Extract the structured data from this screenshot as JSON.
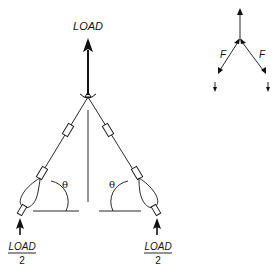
{
  "diagram": {
    "top_load_label": "LOAD",
    "angle_label_left": "θ",
    "angle_label_right": "θ",
    "bottom_left": {
      "numerator": "LOAD",
      "denominator": "2"
    },
    "bottom_right": {
      "numerator": "LOAD",
      "denominator": "2"
    },
    "free_body": {
      "force_label_left": "F",
      "force_label_right": "F"
    },
    "colors": {
      "ink": "#111111",
      "background": "#ffffff"
    }
  }
}
